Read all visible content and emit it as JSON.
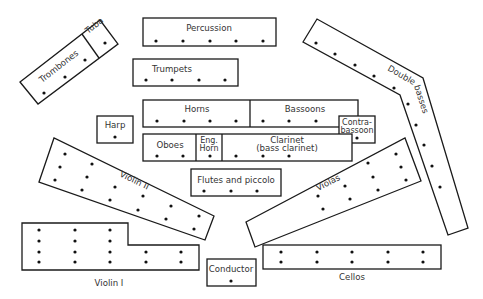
{
  "diagram": {
    "sections": {
      "trombones": {
        "label": "Trombones",
        "players": 3
      },
      "tuba": {
        "label": "Tuba",
        "players": 1
      },
      "percussion": {
        "label": "Percussion",
        "players": 5
      },
      "trumpets": {
        "label": "Trumpets",
        "players": 4
      },
      "horns": {
        "label": "Horns",
        "players": 4
      },
      "bassoons": {
        "label": "Bassoons",
        "players": 3
      },
      "harp": {
        "label": "Harp",
        "players": 1
      },
      "contrabassoon": {
        "label_line1": "Contra-",
        "label_line2": "bassoon",
        "players": 1
      },
      "oboes": {
        "label": "Oboes",
        "players": 2
      },
      "english_horn": {
        "label_line1": "Eng.",
        "label_line2": "Horn",
        "players": 1
      },
      "clarinet": {
        "label_line1": "Clarinet",
        "label_line2": "(bass clarinet)",
        "players": 3
      },
      "flutes": {
        "label": "Flutes and piccolo",
        "players": 3
      },
      "double_basses": {
        "label": "Double basses",
        "players": 9
      },
      "violin_ii": {
        "label": "Violin II",
        "players": 14
      },
      "violas": {
        "label": "Violas",
        "players": 12
      },
      "violin_i": {
        "label": "Violin I",
        "players": 16
      },
      "conductor": {
        "label": "Conductor",
        "players": 1
      },
      "cellos": {
        "label": "Cellos",
        "players": 10
      }
    }
  }
}
